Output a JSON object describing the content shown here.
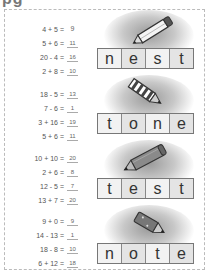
{
  "page": {
    "title_fragment": "pg"
  },
  "sections": [
    {
      "equations": [
        {
          "expr": "4 + 5 =",
          "answer": "9",
          "underlined": false
        },
        {
          "expr": "5 + 6 =",
          "answer": "11",
          "underlined": true
        },
        {
          "expr": "20 - 4 =",
          "answer": "16",
          "underlined": true
        },
        {
          "expr": "2 + 8 =",
          "answer": "10",
          "underlined": true
        }
      ],
      "image": "pencil-icon",
      "word": [
        "n",
        "e",
        "s",
        "t"
      ]
    },
    {
      "equations": [
        {
          "expr": "18 - 5 =",
          "answer": "13",
          "underlined": true
        },
        {
          "expr": "7 - 6 =",
          "answer": "1",
          "underlined": true
        },
        {
          "expr": "3 + 16 =",
          "answer": "19",
          "underlined": true
        },
        {
          "expr": "5 + 6 =",
          "answer": "11",
          "underlined": true
        }
      ],
      "image": "striped-pencil-icon",
      "word": [
        "t",
        "o",
        "n",
        "e"
      ]
    },
    {
      "equations": [
        {
          "expr": "10 + 10 =",
          "answer": "20",
          "underlined": true
        },
        {
          "expr": "2 + 6 =",
          "answer": "8",
          "underlined": true
        },
        {
          "expr": "12 - 5 =",
          "answer": "7",
          "underlined": true
        },
        {
          "expr": "13 + 7 =",
          "answer": "20",
          "underlined": true
        }
      ],
      "image": "crayon-icon",
      "word": [
        "t",
        "e",
        "s",
        "t"
      ]
    },
    {
      "equations": [
        {
          "expr": "9 + 0 =",
          "answer": "9",
          "underlined": true
        },
        {
          "expr": "14 - 13 =",
          "answer": "1",
          "underlined": true
        },
        {
          "expr": "18 - 8 =",
          "answer": "10",
          "underlined": true
        },
        {
          "expr": "6 + 12 =",
          "answer": "18",
          "underlined": true
        }
      ],
      "image": "short-pencil-icon",
      "word": [
        "n",
        "o",
        "t",
        "e"
      ]
    }
  ]
}
